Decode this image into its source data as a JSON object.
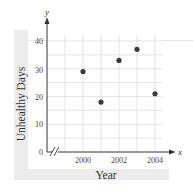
{
  "chart_data": {
    "type": "scatter",
    "title": "",
    "xlabel": "Year",
    "ylabel": "Unhealthy Days",
    "x_axis_symbol": "x",
    "y_axis_symbol": "y",
    "x": [
      2000,
      2001,
      2002,
      2003,
      2004
    ],
    "y": [
      29,
      18,
      33,
      37,
      21
    ],
    "points": [
      {
        "year": 2000,
        "days": 29
      },
      {
        "year": 2001,
        "days": 18
      },
      {
        "year": 2002,
        "days": 33
      },
      {
        "year": 2003,
        "days": 37
      },
      {
        "year": 2004,
        "days": 21
      }
    ],
    "xticks": [
      "2000",
      "2002",
      "2004"
    ],
    "yticks": [
      "0",
      "10",
      "20",
      "30",
      "40"
    ],
    "xlim": [
      1998,
      2004
    ],
    "ylim": [
      0,
      40
    ],
    "x_axis_break": true,
    "grid": true,
    "grid_y_step": 5,
    "grid_x_step": 1,
    "legend": null,
    "marker_color": "#3a3a3a"
  },
  "labels": {
    "y_axis_title": "Unhealthy Days",
    "x_axis_title": "Year",
    "x_symbol": "x",
    "y_symbol": "y",
    "ytick_0": "0",
    "ytick_10": "10",
    "ytick_20": "20",
    "ytick_30": "30",
    "ytick_40": "40",
    "xtick_2000": "2000",
    "xtick_2002": "2002",
    "xtick_2004": "2004"
  }
}
